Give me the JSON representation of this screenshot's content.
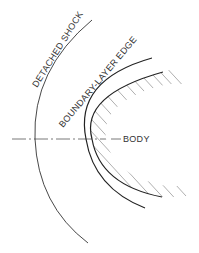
{
  "diagram": {
    "labels": {
      "shock": "DETACHED SHOCK",
      "boundary_layer": "BOUNDARY-LAYER EDGE",
      "body": "BODY"
    },
    "colors": {
      "line": "#222222",
      "hatch": "#9a9a9a",
      "centerline": "#555555",
      "background": "#ffffff"
    }
  }
}
